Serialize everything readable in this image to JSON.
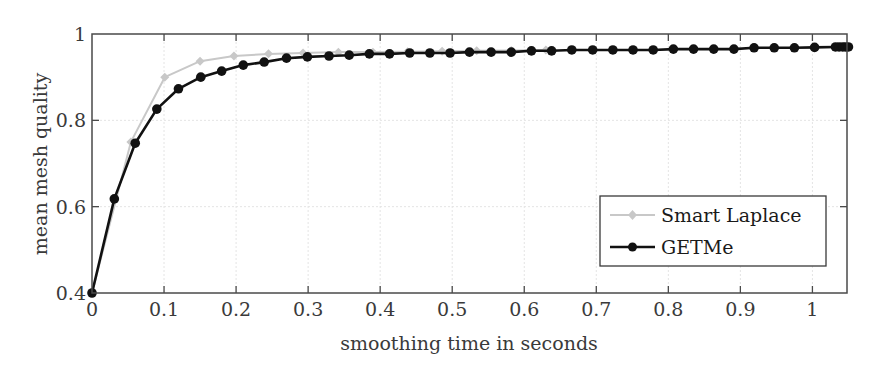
{
  "chart_data": {
    "type": "line",
    "title": "",
    "xlabel": "smoothing time in seconds",
    "ylabel": "mean mesh quality",
    "xlim": [
      0,
      1.048
    ],
    "ylim": [
      0.4,
      1.0
    ],
    "xticks": [
      0,
      0.1,
      0.2,
      0.3,
      0.4,
      0.5,
      0.6,
      0.7,
      0.8,
      0.9,
      1
    ],
    "xtick_labels": [
      "0",
      "0.1",
      "0.2",
      "0.3",
      "0.4",
      "0.5",
      "0.6",
      "0.7",
      "0.8",
      "0.9",
      "1"
    ],
    "yticks": [
      0.4,
      0.6,
      0.8,
      1.0
    ],
    "ytick_labels": [
      "0.4",
      "0.6",
      "0.8",
      "1"
    ],
    "grid": true,
    "legend_position": "lower right",
    "series": [
      {
        "name": "Smart Laplace",
        "color": "#c8c8c8",
        "marker": "diamond",
        "x": [
          0,
          0.054,
          0.101,
          0.15,
          0.197,
          0.245,
          0.293,
          0.342,
          0.39,
          0.438,
          0.486,
          0.534,
          0.582,
          0.63
        ],
        "y": [
          0.4,
          0.75,
          0.9,
          0.937,
          0.949,
          0.954,
          0.956,
          0.958,
          0.958,
          0.959,
          0.96,
          0.961,
          0.962,
          0.963
        ]
      },
      {
        "name": "GETMe",
        "color": "#111111",
        "marker": "circle",
        "x": [
          0,
          0.031,
          0.06,
          0.09,
          0.12,
          0.151,
          0.18,
          0.21,
          0.239,
          0.27,
          0.299,
          0.329,
          0.357,
          0.385,
          0.413,
          0.441,
          0.469,
          0.497,
          0.524,
          0.554,
          0.582,
          0.61,
          0.638,
          0.666,
          0.695,
          0.723,
          0.751,
          0.779,
          0.807,
          0.835,
          0.863,
          0.891,
          0.919,
          0.947,
          0.975,
          1.003,
          1.032,
          1.037,
          1.042,
          1.046,
          1.05
        ],
        "y": [
          0.4,
          0.618,
          0.747,
          0.826,
          0.873,
          0.9,
          0.914,
          0.928,
          0.935,
          0.944,
          0.947,
          0.949,
          0.951,
          0.954,
          0.954,
          0.956,
          0.956,
          0.956,
          0.958,
          0.958,
          0.958,
          0.961,
          0.961,
          0.963,
          0.963,
          0.963,
          0.963,
          0.963,
          0.965,
          0.965,
          0.965,
          0.965,
          0.968,
          0.968,
          0.968,
          0.969,
          0.97,
          0.97,
          0.97,
          0.97,
          0.97
        ]
      }
    ]
  },
  "legend": {
    "items": [
      {
        "label": "Smart Laplace"
      },
      {
        "label": "GETMe"
      }
    ]
  }
}
